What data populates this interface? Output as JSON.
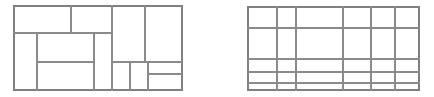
{
  "image": {
    "width": 434,
    "height": 97,
    "background_color": "#ffffff",
    "line_color": "#8a8a8a",
    "outer_line_color": "#808080",
    "description": "Two black-and-white line drawings side by side: a rectangle partitioned into irregular sub-rectangles, and a rectangle partitioned by a grid of uneven rows and columns.",
    "figure_count": 2
  },
  "figures": [
    {
      "name": "irregular-partition-figure",
      "label": "",
      "bounds": {
        "x": 14,
        "y": 6,
        "width": 168,
        "height": 84
      },
      "cell_count": 13,
      "segments": [
        {
          "id": "outer-top",
          "kind": "horizontal",
          "x1": 14,
          "y1": 6,
          "x2": 182,
          "y2": 6,
          "outer": true
        },
        {
          "id": "outer-bottom",
          "kind": "horizontal",
          "x1": 14,
          "y1": 90,
          "x2": 182,
          "y2": 90,
          "outer": true
        },
        {
          "id": "outer-left",
          "kind": "vertical",
          "x1": 14,
          "y1": 6,
          "x2": 14,
          "y2": 90,
          "outer": true
        },
        {
          "id": "outer-right",
          "kind": "vertical",
          "x1": 182,
          "y1": 6,
          "x2": 182,
          "y2": 90,
          "outer": true
        },
        {
          "id": "h-upper-left",
          "kind": "horizontal",
          "x1": 14,
          "y1": 33,
          "x2": 112,
          "y2": 33,
          "outer": false
        },
        {
          "id": "h-mid-band",
          "kind": "horizontal",
          "x1": 37,
          "y1": 62,
          "x2": 94,
          "y2": 62,
          "outer": false
        },
        {
          "id": "h-right-upper",
          "kind": "horizontal",
          "x1": 112,
          "y1": 62,
          "x2": 182,
          "y2": 62,
          "outer": false
        },
        {
          "id": "h-right-lower",
          "kind": "horizontal",
          "x1": 148,
          "y1": 74,
          "x2": 182,
          "y2": 74,
          "outer": false
        },
        {
          "id": "v-top-a",
          "kind": "vertical",
          "x1": 71,
          "y1": 6,
          "x2": 71,
          "y2": 33,
          "outer": false
        },
        {
          "id": "v-top-b",
          "kind": "vertical",
          "x1": 112,
          "y1": 6,
          "x2": 112,
          "y2": 62,
          "outer": false
        },
        {
          "id": "v-top-c",
          "kind": "vertical",
          "x1": 145,
          "y1": 6,
          "x2": 145,
          "y2": 62,
          "outer": false
        },
        {
          "id": "v-mid-left",
          "kind": "vertical",
          "x1": 37,
          "y1": 33,
          "x2": 37,
          "y2": 90,
          "outer": false
        },
        {
          "id": "v-mid-right",
          "kind": "vertical",
          "x1": 94,
          "y1": 33,
          "x2": 94,
          "y2": 90,
          "outer": false
        },
        {
          "id": "v-low-block",
          "kind": "vertical",
          "x1": 112,
          "y1": 62,
          "x2": 112,
          "y2": 90,
          "outer": false
        },
        {
          "id": "v-low-a",
          "kind": "vertical",
          "x1": 130,
          "y1": 62,
          "x2": 130,
          "y2": 90,
          "outer": false
        },
        {
          "id": "v-low-b",
          "kind": "vertical",
          "x1": 148,
          "y1": 62,
          "x2": 148,
          "y2": 90,
          "outer": false
        }
      ]
    },
    {
      "name": "uneven-grid-figure",
      "label": "",
      "bounds": {
        "x": 248,
        "y": 7,
        "width": 171,
        "height": 83
      },
      "rows": 5,
      "columns": 6,
      "column_x": [
        248,
        277,
        296,
        343,
        371,
        395,
        419
      ],
      "row_y": [
        7,
        28,
        59,
        72,
        83,
        90
      ],
      "segments": [
        {
          "id": "grid-outer-top",
          "kind": "horizontal",
          "x1": 248,
          "y1": 7,
          "x2": 419,
          "y2": 7,
          "outer": true
        },
        {
          "id": "grid-outer-bottom",
          "kind": "horizontal",
          "x1": 248,
          "y1": 90,
          "x2": 419,
          "y2": 90,
          "outer": true
        },
        {
          "id": "grid-outer-left",
          "kind": "vertical",
          "x1": 248,
          "y1": 7,
          "x2": 248,
          "y2": 90,
          "outer": true
        },
        {
          "id": "grid-outer-right",
          "kind": "vertical",
          "x1": 419,
          "y1": 7,
          "x2": 419,
          "y2": 90,
          "outer": true
        },
        {
          "id": "grid-h-1",
          "kind": "horizontal",
          "x1": 248,
          "y1": 28,
          "x2": 419,
          "y2": 28,
          "outer": false
        },
        {
          "id": "grid-h-2",
          "kind": "horizontal",
          "x1": 248,
          "y1": 59,
          "x2": 419,
          "y2": 59,
          "outer": false
        },
        {
          "id": "grid-h-3",
          "kind": "horizontal",
          "x1": 248,
          "y1": 72,
          "x2": 419,
          "y2": 72,
          "outer": false
        },
        {
          "id": "grid-h-4",
          "kind": "horizontal",
          "x1": 248,
          "y1": 83,
          "x2": 419,
          "y2": 83,
          "outer": false
        },
        {
          "id": "grid-v-1",
          "kind": "vertical",
          "x1": 277,
          "y1": 7,
          "x2": 277,
          "y2": 90,
          "outer": false
        },
        {
          "id": "grid-v-2",
          "kind": "vertical",
          "x1": 296,
          "y1": 7,
          "x2": 296,
          "y2": 90,
          "outer": false
        },
        {
          "id": "grid-v-3",
          "kind": "vertical",
          "x1": 343,
          "y1": 7,
          "x2": 343,
          "y2": 90,
          "outer": false
        },
        {
          "id": "grid-v-4",
          "kind": "vertical",
          "x1": 371,
          "y1": 7,
          "x2": 371,
          "y2": 90,
          "outer": false
        },
        {
          "id": "grid-v-5",
          "kind": "vertical",
          "x1": 395,
          "y1": 7,
          "x2": 395,
          "y2": 90,
          "outer": false
        }
      ]
    }
  ]
}
